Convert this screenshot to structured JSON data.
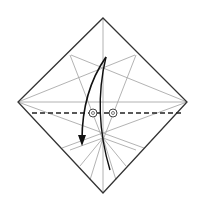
{
  "diagram": {
    "type": "origami-fold-step",
    "background": "#ffffff",
    "paper": {
      "shape": "square-rotated-45",
      "outline_color": "#333333",
      "corners": {
        "top": [
          103,
          18
        ],
        "right": [
          187,
          102
        ],
        "bottom": [
          103,
          193
        ],
        "left": [
          18,
          102
        ]
      }
    },
    "crease_color": "#999999",
    "fold_line": {
      "style": "dashed",
      "meaning": "valley-fold",
      "y": 113,
      "x1": 32,
      "x2": 181,
      "color": "#222222"
    },
    "reference_points": [
      {
        "name": "pivot-left",
        "cx": 93,
        "cy": 113
      },
      {
        "name": "pivot-right",
        "cx": 113,
        "cy": 113
      }
    ],
    "arrow": {
      "meaning": "fold-down",
      "color": "#111111"
    }
  }
}
